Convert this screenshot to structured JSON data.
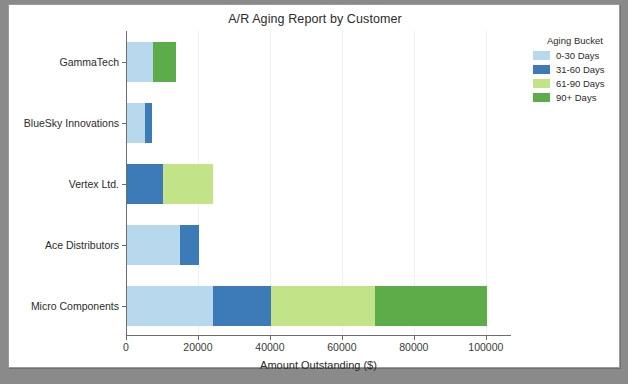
{
  "figure": {
    "title": "A/R Aging Report by Customer",
    "background": "#ffffff",
    "frame_color": "#9a9a9a"
  },
  "legend": {
    "title": "Aging Bucket",
    "position": "upper right outside",
    "items": [
      {
        "label": "0-30 Days",
        "color": "#b8d9ed"
      },
      {
        "label": "31-60 Days",
        "color": "#3d7ab8"
      },
      {
        "label": "61-90 Days",
        "color": "#c2e388"
      },
      {
        "label": "90+ Days",
        "color": "#5cad4a"
      }
    ]
  },
  "chart_data": {
    "type": "bar",
    "orientation": "horizontal",
    "stacked": true,
    "title": "A/R Aging Report by Customer",
    "xlabel": "Amount Outstanding ($)",
    "ylabel": "",
    "xlim": [
      0,
      107000
    ],
    "xticks": [
      0,
      20000,
      40000,
      60000,
      80000,
      100000
    ],
    "xtick_labels": [
      "0",
      "20000",
      "40000",
      "60000",
      "80000",
      "100000"
    ],
    "grid": true,
    "legend_title": "Aging Bucket",
    "categories": [
      "GammaTech",
      "BlueSky Innovations",
      "Vertex Ltd.",
      "Ace Distributors",
      "Micro Components"
    ],
    "series": [
      {
        "name": "0-30 Days",
        "color": "#b8d9ed",
        "values": [
          7200,
          5000,
          0,
          14800,
          24000
        ]
      },
      {
        "name": "31-60 Days",
        "color": "#3d7ab8",
        "values": [
          0,
          2000,
          10100,
          5300,
          16000
        ]
      },
      {
        "name": "61-90 Days",
        "color": "#c2e388",
        "values": [
          0,
          0,
          13900,
          0,
          28800
        ]
      },
      {
        "name": "90+ Days",
        "color": "#5cad4a",
        "values": [
          6400,
          0,
          0,
          0,
          31200
        ]
      }
    ],
    "totals": [
      13600,
      7000,
      24000,
      20100,
      100000
    ]
  }
}
